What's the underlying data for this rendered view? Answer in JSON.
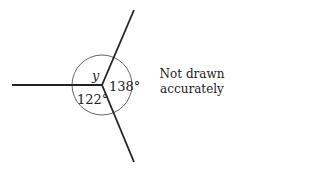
{
  "diagram": {
    "type": "angles-at-a-point",
    "center": {
      "x": 102,
      "y": 85
    },
    "rays": [
      {
        "name": "ray-left",
        "x2": 12,
        "y2": 85
      },
      {
        "name": "ray-top",
        "x2": 134,
        "y2": 10
      },
      {
        "name": "ray-bottom",
        "x2": 134,
        "y2": 162
      }
    ],
    "arc_radius": 30,
    "angles": [
      {
        "name": "angle-y",
        "label": "y",
        "value": null,
        "between": [
          "ray-left",
          "ray-top"
        ],
        "label_pos": {
          "x": 92,
          "y": 80
        }
      },
      {
        "name": "angle-138",
        "label": "138°",
        "value": 138,
        "between": [
          "ray-top",
          "ray-bottom"
        ],
        "label_pos": {
          "x": 109,
          "y": 91
        }
      },
      {
        "name": "angle-122",
        "label": "122°",
        "value": 122,
        "between": [
          "ray-bottom",
          "ray-left"
        ],
        "label_pos": {
          "x": 77,
          "y": 104
        }
      }
    ],
    "note": {
      "line1": "Not drawn",
      "line2": "accurately"
    },
    "colors": {
      "line": "#222222",
      "arc": "#555555",
      "text": "#222222",
      "background": "#ffffff"
    }
  }
}
